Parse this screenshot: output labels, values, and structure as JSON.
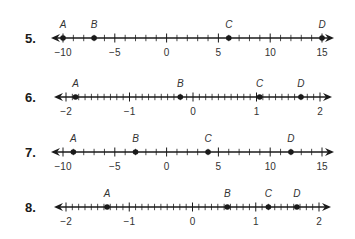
{
  "colors": {
    "line": "#1a1a1a",
    "text": "#333333",
    "background": "#ffffff"
  },
  "problems": [
    {
      "number": "5.",
      "y": 38,
      "min": -10,
      "max": 15,
      "x_min": 63,
      "x_max": 322,
      "minor_step": 1,
      "major_step": 5,
      "tick_labels": [
        "−10",
        "−5",
        "0",
        "5",
        "10",
        "15"
      ],
      "tick_values": [
        -10,
        -5,
        0,
        5,
        10,
        15
      ],
      "points": [
        {
          "label": "A",
          "value": -10
        },
        {
          "label": "B",
          "value": -7
        },
        {
          "label": "C",
          "value": 6
        },
        {
          "label": "D",
          "value": 15
        }
      ]
    },
    {
      "number": "6.",
      "y": 97,
      "min": -2,
      "max": 2,
      "x_min": 66,
      "x_max": 320,
      "minor_step": 0.1,
      "major_step": 1,
      "tick_labels": [
        "−2",
        "−1",
        "0",
        "1",
        "2"
      ],
      "tick_values": [
        -2,
        -1,
        0,
        1,
        2
      ],
      "points": [
        {
          "label": "A",
          "value": -1.85
        },
        {
          "label": "B",
          "value": -0.2
        },
        {
          "label": "C",
          "value": 1.05
        },
        {
          "label": "D",
          "value": 1.7
        }
      ]
    },
    {
      "number": "7.",
      "y": 152,
      "min": -10,
      "max": 15,
      "x_min": 63,
      "x_max": 322,
      "minor_step": 1,
      "major_step": 5,
      "tick_labels": [
        "−10",
        "−5",
        "0",
        "5",
        "10",
        "15"
      ],
      "tick_values": [
        -10,
        -5,
        0,
        5,
        10,
        15
      ],
      "points": [
        {
          "label": "A",
          "value": -9
        },
        {
          "label": "B",
          "value": -3
        },
        {
          "label": "C",
          "value": 4
        },
        {
          "label": "D",
          "value": 12
        }
      ]
    },
    {
      "number": "8.",
      "y": 207,
      "min": -2,
      "max": 2,
      "x_min": 66,
      "x_max": 319,
      "minor_step": 0.1,
      "major_step": 1,
      "tick_labels": [
        "−2",
        "−1",
        "0",
        "1",
        "2"
      ],
      "tick_values": [
        -2,
        -1,
        0,
        1,
        2
      ],
      "points": [
        {
          "label": "A",
          "value": -1.35
        },
        {
          "label": "B",
          "value": 0.55
        },
        {
          "label": "C",
          "value": 1.2
        },
        {
          "label": "D",
          "value": 1.65
        }
      ]
    }
  ]
}
